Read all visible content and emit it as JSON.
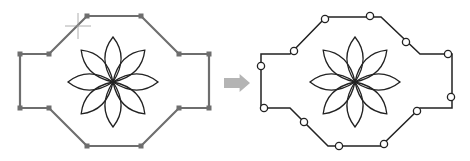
{
  "figure": {
    "colors": {
      "left_outline": "#6e6e6e",
      "left_grip": "#6e6e6e",
      "right_outline": "#222222",
      "node_fill": "#ffffff",
      "flower": "#222222",
      "arrow": "#b4b4b4",
      "crosshair": "#9a9a9a"
    },
    "left_panel": {
      "vertices": [
        [
          87,
          16
        ],
        [
          141,
          16
        ],
        [
          179,
          54
        ],
        [
          209,
          54
        ],
        [
          209,
          108
        ],
        [
          179,
          108
        ],
        [
          141,
          146
        ],
        [
          87,
          146
        ],
        [
          49,
          108
        ],
        [
          20,
          108
        ],
        [
          20,
          54
        ],
        [
          49,
          54
        ]
      ],
      "flower_center": [
        113,
        82
      ],
      "petal_count": 8,
      "petal_length": 45,
      "crosshair": [
        78,
        26
      ]
    },
    "arrow": {
      "x": 224,
      "y": 74,
      "width": 26,
      "height": 18
    },
    "right_panel": {
      "vertices": [
        [
          326,
          17
        ],
        [
          381,
          17
        ],
        [
          420,
          54
        ],
        [
          452,
          54
        ],
        [
          452,
          108
        ],
        [
          420,
          108
        ],
        [
          381,
          146
        ],
        [
          328,
          146
        ],
        [
          290,
          108
        ],
        [
          261,
          108
        ],
        [
          261,
          54
        ],
        [
          290,
          54
        ]
      ],
      "nodes": [
        [
          325,
          19
        ],
        [
          370,
          16
        ],
        [
          406,
          42
        ],
        [
          448,
          54
        ],
        [
          451,
          97
        ],
        [
          417,
          111
        ],
        [
          384,
          144
        ],
        [
          339,
          146
        ],
        [
          304,
          122
        ],
        [
          264,
          108
        ],
        [
          261,
          66
        ],
        [
          294,
          51
        ]
      ],
      "flower_center": [
        355,
        82
      ],
      "petal_count": 8,
      "petal_length": 45
    }
  }
}
